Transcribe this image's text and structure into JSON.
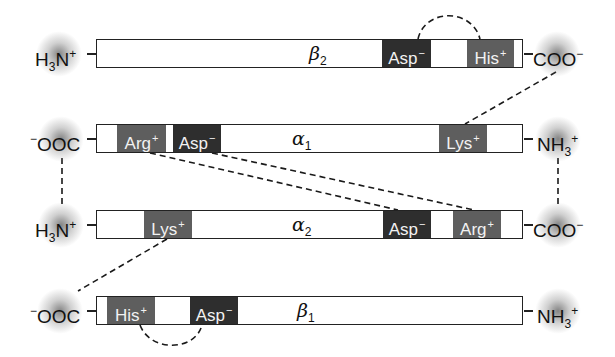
{
  "diagram": {
    "type": "hemoglobin-deoxy-salt-bridges",
    "colors": {
      "negative_residue": "#2e2e2e",
      "positive_residue": "#5e5e5e",
      "outline": "#222222",
      "glow": "#8a8a8a"
    },
    "chains": [
      {
        "id": "beta2",
        "label": "β",
        "subscript": "2",
        "left_terminus": {
          "text": "H",
          "sub": "3",
          "rest": "N",
          "sup": "+"
        },
        "right_terminus": {
          "text": "COO",
          "sup": "−"
        },
        "residues": [
          {
            "name": "Asp",
            "charge": "−"
          },
          {
            "name": "His",
            "charge": "+"
          }
        ]
      },
      {
        "id": "alpha1",
        "label": "α",
        "subscript": "1",
        "left_terminus": {
          "pre": "−",
          "text": "OOC"
        },
        "right_terminus": {
          "text": "NH",
          "sub": "3",
          "sup": "+"
        },
        "residues": [
          {
            "name": "Arg",
            "charge": "+"
          },
          {
            "name": "Asp",
            "charge": "−"
          },
          {
            "name": "Lys",
            "charge": "+"
          }
        ]
      },
      {
        "id": "alpha2",
        "label": "α",
        "subscript": "2",
        "left_terminus": {
          "text": "H",
          "sub": "3",
          "rest": "N",
          "sup": "+"
        },
        "right_terminus": {
          "text": "COO",
          "sup": "−"
        },
        "residues": [
          {
            "name": "Lys",
            "charge": "+"
          },
          {
            "name": "Asp",
            "charge": "−"
          },
          {
            "name": "Arg",
            "charge": "+"
          }
        ]
      },
      {
        "id": "beta1",
        "label": "β",
        "subscript": "1",
        "left_terminus": {
          "pre": "−",
          "text": "OOC"
        },
        "right_terminus": {
          "text": "NH",
          "sub": "3",
          "sup": "+"
        },
        "residues": [
          {
            "name": "His",
            "charge": "+"
          },
          {
            "name": "Asp",
            "charge": "−"
          }
        ]
      }
    ],
    "salt_bridges": [
      {
        "from": "beta2.Asp−",
        "to": "beta2.His+",
        "style": "arc-above"
      },
      {
        "from": "beta2.COO−",
        "to": "alpha1.Lys+",
        "style": "dashed"
      },
      {
        "from": "alpha1.Arg+",
        "to": "alpha2.Asp−",
        "style": "dashed"
      },
      {
        "from": "alpha1.Asp−",
        "to": "alpha2.Arg+",
        "style": "dashed"
      },
      {
        "from": "alpha1.COO−",
        "to": "alpha2.NH3+",
        "style": "dashed-vertical"
      },
      {
        "from": "alpha1.NH3+",
        "to": "alpha2.COO−",
        "style": "dashed-vertical"
      },
      {
        "from": "alpha2.Lys+",
        "to": "beta1.COO−",
        "style": "dashed"
      },
      {
        "from": "beta1.His+",
        "to": "beta1.Asp−",
        "style": "arc-below"
      }
    ]
  }
}
